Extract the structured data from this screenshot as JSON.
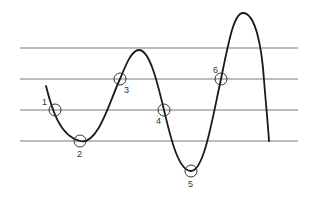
{
  "diagram": {
    "type": "wave-crossing-diagram",
    "reference_lines": [
      {
        "y": 48,
        "x1": 20,
        "x2": 298
      },
      {
        "y": 79,
        "x1": 20,
        "x2": 298
      },
      {
        "y": 110,
        "x1": 20,
        "x2": 298
      },
      {
        "y": 141,
        "x1": 20,
        "x2": 298
      }
    ],
    "curve": {
      "start": [
        46,
        86
      ],
      "min_1": [
        80,
        141
      ],
      "peak_1": [
        139,
        50
      ],
      "min_2": [
        191,
        171
      ],
      "peak_2": [
        243,
        13
      ],
      "end": [
        269,
        141
      ],
      "color": "#1a1a1a"
    },
    "points": [
      {
        "id": "1",
        "label": "1",
        "cx": 55,
        "cy": 110,
        "lx": 42,
        "ly": 105
      },
      {
        "id": "2",
        "label": "2",
        "cx": 80,
        "cy": 141,
        "lx": 77,
        "ly": 157
      },
      {
        "id": "3",
        "label": "3",
        "cx": 120,
        "cy": 79,
        "lx": 124,
        "ly": 93
      },
      {
        "id": "4",
        "label": "4",
        "cx": 164,
        "cy": 110,
        "lx": 156,
        "ly": 124
      },
      {
        "id": "5",
        "label": "5",
        "cx": 191,
        "cy": 171,
        "lx": 188,
        "ly": 187
      },
      {
        "id": "6",
        "label": "6",
        "cx": 221,
        "cy": 79,
        "lx": 213,
        "ly": 73
      }
    ],
    "marker_radius": 6
  }
}
